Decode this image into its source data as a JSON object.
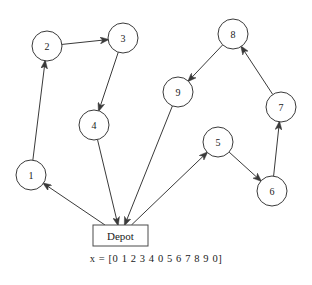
{
  "diagram": {
    "caption": "x = [0 1 2 3 4 0 5 6 7 8 9 0]",
    "stroke_color": "#3a3a3a",
    "background_color": "#ffffff",
    "depot": {
      "label": "Depot",
      "x": 120.5,
      "y": 235.5,
      "width": 55,
      "height": 21
    },
    "node_radius": 15,
    "nodes": [
      {
        "id": "1",
        "label": "1",
        "x": 31,
        "y": 175
      },
      {
        "id": "2",
        "label": "2",
        "x": 47,
        "y": 46
      },
      {
        "id": "3",
        "label": "3",
        "x": 123,
        "y": 38
      },
      {
        "id": "4",
        "label": "4",
        "x": 94,
        "y": 125
      },
      {
        "id": "5",
        "label": "5",
        "x": 218,
        "y": 142
      },
      {
        "id": "6",
        "label": "6",
        "x": 272,
        "y": 191
      },
      {
        "id": "7",
        "label": "7",
        "x": 281,
        "y": 107
      },
      {
        "id": "8",
        "label": "8",
        "x": 233,
        "y": 34
      },
      {
        "id": "9",
        "label": "9",
        "x": 178,
        "y": 92
      }
    ],
    "edges": [
      {
        "from": "depot",
        "to": "1",
        "label": "depot-to-1"
      },
      {
        "from": "1",
        "to": "2",
        "label": "1-to-2"
      },
      {
        "from": "2",
        "to": "3",
        "label": "2-to-3"
      },
      {
        "from": "3",
        "to": "4",
        "label": "3-to-4"
      },
      {
        "from": "4",
        "to": "depot",
        "label": "4-to-depot"
      },
      {
        "from": "depot",
        "to": "5",
        "label": "depot-to-5"
      },
      {
        "from": "5",
        "to": "6",
        "label": "5-to-6"
      },
      {
        "from": "6",
        "to": "7",
        "label": "6-to-7"
      },
      {
        "from": "7",
        "to": "8",
        "label": "7-to-8"
      },
      {
        "from": "8",
        "to": "9",
        "label": "8-to-9"
      },
      {
        "from": "9",
        "to": "depot",
        "label": "9-to-depot"
      }
    ]
  }
}
